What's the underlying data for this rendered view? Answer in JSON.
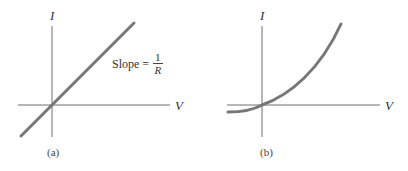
{
  "panels": [
    {
      "id": "a",
      "caption": "(a)",
      "y_axis_label": "I",
      "x_axis_label": "V",
      "annotation": {
        "prefix": "Slope =",
        "numerator": "1",
        "denominator": "R"
      },
      "curve": "linear through origin"
    },
    {
      "id": "b",
      "caption": "(b)",
      "y_axis_label": "I",
      "x_axis_label": "V",
      "curve": "nonlinear (diode-like), flat negative for V<0, rising steeply for V>0"
    }
  ],
  "colors": {
    "axis": "#6e6e6e",
    "curve": "#777777",
    "text": "#333333"
  }
}
